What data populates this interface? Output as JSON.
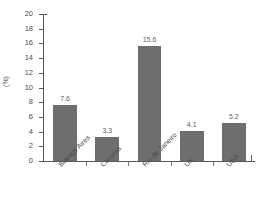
{
  "chart_data": {
    "type": "bar",
    "title": "",
    "xlabel": "",
    "ylabel": "(%)",
    "categories": [
      "Buenos Aires",
      "Caracas",
      "Rio de Janeiro",
      "UK",
      "USA"
    ],
    "values": [
      7.6,
      3.3,
      15.6,
      4.1,
      5.2
    ],
    "value_labels": [
      "7.6",
      "3.3",
      "15.6",
      "4.1",
      "5.2"
    ],
    "ylim": [
      0,
      20
    ],
    "ytick_step": 2,
    "ytick_labels": [
      "0",
      "2",
      "4",
      "6",
      "8",
      "10",
      "12",
      "14",
      "16",
      "18",
      "20"
    ],
    "grid": false,
    "legend": false,
    "bar_color": "#6e6e6e",
    "axis_color": "#5a5a5a",
    "text_color": "#4a4a4a",
    "background": "#ffffff"
  }
}
